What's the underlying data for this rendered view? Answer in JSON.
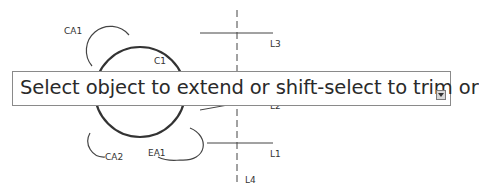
{
  "drawing": {
    "labels": {
      "ca1": "CA1",
      "c1": "C1",
      "l3": "L3",
      "l2": "L2",
      "l1": "L1",
      "l4": "L4",
      "ca2": "CA2",
      "ea1": "EA1"
    }
  },
  "tooltip": {
    "prompt": "Select object to extend or shift-select to trim or",
    "expand_icon": "expand-down-icon"
  }
}
